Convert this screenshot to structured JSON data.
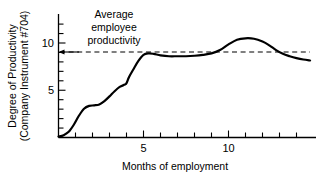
{
  "figure": {
    "background_color": "#ffffff",
    "line_color": "#000000"
  },
  "axis_titles": {
    "y_line1": "Degree of Productivity",
    "y_line2": "(Company Instrument #704)",
    "x": "Months of employment"
  },
  "annotation": {
    "line1": "Average",
    "line2": "employee",
    "line3": "productivity"
  },
  "ticks": {
    "y_labels": [
      "5",
      "10"
    ],
    "x_labels": [
      "5",
      "10"
    ]
  },
  "chart_data": {
    "type": "line",
    "title": "",
    "xlabel": "Months of employment",
    "ylabel": "Degree of Productivity (Company Instrument #704)",
    "xlim": [
      0,
      14.8
    ],
    "ylim": [
      0,
      12.5
    ],
    "xticks": [
      1,
      2,
      3,
      4,
      5,
      6,
      7,
      8,
      9,
      10,
      11,
      12,
      13,
      14
    ],
    "xtick_labels": {
      "5": "5",
      "10": "10"
    },
    "yticks": [
      1,
      2,
      3,
      4,
      5,
      6,
      7,
      8,
      9,
      10,
      11,
      12
    ],
    "ytick_labels": {
      "5": "5",
      "10": "10"
    },
    "grid": false,
    "legend": null,
    "series": [
      {
        "name": "Individual productivity",
        "style": "solid",
        "width": 2.2,
        "color": "#000000",
        "x": [
          0.0,
          0.3,
          0.6,
          0.9,
          1.2,
          1.5,
          1.8,
          2.1,
          2.4,
          2.7,
          3.0,
          3.3,
          3.6,
          3.9,
          4.0,
          4.15,
          4.4,
          4.7,
          5.0,
          5.3,
          5.6,
          6.0,
          6.5,
          7.0,
          7.5,
          8.0,
          8.5,
          9.0,
          9.5,
          10.0,
          10.5,
          11.0,
          11.5,
          12.0,
          12.4,
          12.8,
          13.2,
          13.6,
          14.0,
          14.4,
          14.8
        ],
        "y": [
          0.1,
          0.25,
          0.6,
          1.35,
          2.3,
          3.05,
          3.35,
          3.4,
          3.5,
          3.85,
          4.35,
          4.9,
          5.35,
          5.6,
          5.75,
          6.4,
          7.2,
          8.1,
          8.75,
          8.9,
          8.85,
          8.7,
          8.6,
          8.6,
          8.6,
          8.65,
          8.75,
          8.9,
          9.25,
          9.85,
          10.35,
          10.5,
          10.45,
          10.15,
          9.75,
          9.25,
          8.85,
          8.6,
          8.4,
          8.25,
          8.15
        ]
      }
    ],
    "reference_line": {
      "name": "Average employee productivity",
      "style": "dashed",
      "orientation": "horizontal",
      "y": 8.9,
      "x_start": 0.0,
      "x_end": 14.8,
      "color": "#000000",
      "label": "Average employee productivity",
      "has_arrow_to_axis": true
    }
  }
}
